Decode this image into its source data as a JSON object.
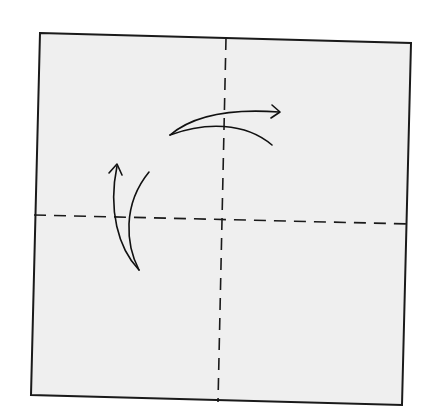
{
  "diagram": {
    "type": "origami-fold-diagram",
    "colors": {
      "background": "#ffffff",
      "paper_fill": "#efefef",
      "line": "#1a1a1a"
    },
    "paper": {
      "shape": "square",
      "corners": {
        "top_left": [
          40,
          33
        ],
        "top_right": [
          411,
          43
        ],
        "bottom_right": [
          402,
          405
        ],
        "bottom_left": [
          31,
          395
        ]
      }
    },
    "fold_lines": [
      {
        "id": "vertical-fold",
        "style": "dashed",
        "from": [
          226,
          37
        ],
        "to": [
          218,
          402
        ]
      },
      {
        "id": "horizontal-fold",
        "style": "dashed",
        "from": [
          34,
          215
        ],
        "to": [
          411,
          224
        ]
      }
    ],
    "arrows": [
      {
        "id": "fold-arrow-left-to-right",
        "direction": "right",
        "meaning": "fold left half over to the right along vertical fold, then unfold"
      },
      {
        "id": "fold-arrow-bottom-to-top",
        "direction": "up",
        "meaning": "fold bottom half up along horizontal fold, then unfold"
      }
    ]
  }
}
